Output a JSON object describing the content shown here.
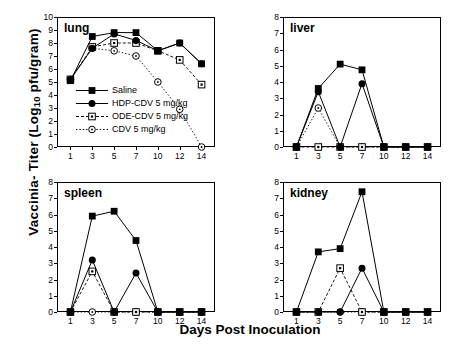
{
  "axes": {
    "ylabel_pre": "Vaccinia- Titer (Log",
    "ylabel_sub": "10",
    "ylabel_post": " pfu/gram)",
    "xlabel": "Days Post  Inoculation"
  },
  "legend": {
    "items": [
      {
        "label": "Saline",
        "marker": "filled-square",
        "line": "solid"
      },
      {
        "label": "HDP-CDV 5 mg/kg",
        "marker": "filled-circle",
        "line": "solid"
      },
      {
        "label": "ODE-CDV 5 mg/kg",
        "marker": "open-square",
        "line": "dashed"
      },
      {
        "label": "CDV 5 mg/kg",
        "marker": "open-circle",
        "line": "dotted"
      }
    ]
  },
  "chart_data": [
    {
      "type": "line",
      "title": "lung",
      "panel": "top-left",
      "x": [
        1,
        3,
        5,
        7,
        10,
        12,
        14
      ],
      "xlabel": "Days Post Inoculation",
      "ylabel": "Vaccinia- Titer (Log10 pfu/gram)",
      "xticklabels": [
        "1",
        "3",
        "5",
        "7",
        "10",
        "12",
        "14"
      ],
      "ylim": [
        0,
        10
      ],
      "yticks": [
        0,
        1,
        2,
        3,
        4,
        5,
        6,
        7,
        8,
        9,
        10
      ],
      "grid": false,
      "series": [
        {
          "name": "Saline",
          "marker": "filled-square",
          "line": "solid",
          "values": [
            5.1,
            8.5,
            8.8,
            8.8,
            7.4,
            8.0,
            6.4
          ]
        },
        {
          "name": "HDP-CDV 5 mg/kg",
          "marker": "filled-circle",
          "line": "solid",
          "values": [
            5.2,
            7.6,
            8.7,
            8.2,
            7.4,
            8.0,
            6.4
          ]
        },
        {
          "name": "ODE-CDV 5 mg/kg",
          "marker": "open-square",
          "line": "dashed",
          "values": [
            5.2,
            7.7,
            8.0,
            8.0,
            7.4,
            6.7,
            4.8
          ]
        },
        {
          "name": "CDV 5 mg/kg",
          "marker": "open-circle",
          "line": "dotted",
          "values": [
            5.2,
            7.6,
            7.4,
            7.0,
            5.0,
            2.9,
            0.0
          ]
        }
      ]
    },
    {
      "type": "line",
      "title": "liver",
      "panel": "top-right",
      "x": [
        1,
        3,
        5,
        7,
        10,
        12,
        14
      ],
      "xlabel": "Days Post Inoculation",
      "ylabel": "Vaccinia- Titer (Log10 pfu/gram)",
      "xticklabels": [
        "1",
        "3",
        "5",
        "7",
        "10",
        "12",
        "14"
      ],
      "ylim": [
        0,
        8
      ],
      "yticks": [
        0,
        1,
        2,
        3,
        4,
        5,
        6,
        7,
        8
      ],
      "grid": false,
      "series": [
        {
          "name": "Saline",
          "marker": "filled-square",
          "line": "solid",
          "values": [
            0.0,
            3.6,
            5.1,
            4.75,
            0.0,
            0.0,
            0.0
          ]
        },
        {
          "name": "HDP-CDV 5 mg/kg",
          "marker": "filled-circle",
          "line": "solid",
          "values": [
            0.0,
            3.4,
            0.0,
            3.9,
            0.0,
            0.0,
            0.0
          ]
        },
        {
          "name": "ODE-CDV 5 mg/kg",
          "marker": "open-square",
          "line": "dashed",
          "values": [
            0.0,
            0.0,
            0.0,
            0.0,
            0.0,
            0.0,
            0.0
          ]
        },
        {
          "name": "CDV 5 mg/kg",
          "marker": "open-circle",
          "line": "dotted",
          "values": [
            0.0,
            2.4,
            0.0,
            0.0,
            0.0,
            0.0,
            0.0
          ]
        }
      ]
    },
    {
      "type": "line",
      "title": "spleen",
      "panel": "bottom-left",
      "x": [
        1,
        3,
        5,
        7,
        10,
        12,
        14
      ],
      "xlabel": "Days Post Inoculation",
      "ylabel": "Vaccinia- Titer (Log10 pfu/gram)",
      "xticklabels": [
        "1",
        "3",
        "5",
        "7",
        "10",
        "12",
        "14"
      ],
      "ylim": [
        0,
        8
      ],
      "yticks": [
        0,
        1,
        2,
        3,
        4,
        5,
        6,
        7,
        8
      ],
      "grid": false,
      "series": [
        {
          "name": "Saline",
          "marker": "filled-square",
          "line": "solid",
          "values": [
            0.0,
            5.9,
            6.2,
            4.4,
            0.0,
            0.0,
            0.0
          ]
        },
        {
          "name": "HDP-CDV 5 mg/kg",
          "marker": "filled-circle",
          "line": "solid",
          "values": [
            0.0,
            3.2,
            0.0,
            2.4,
            0.0,
            0.0,
            0.0
          ]
        },
        {
          "name": "ODE-CDV 5 mg/kg",
          "marker": "open-square",
          "line": "dashed",
          "values": [
            0.0,
            2.5,
            0.0,
            0.0,
            0.0,
            0.0,
            0.0
          ]
        },
        {
          "name": "CDV 5 mg/kg",
          "marker": "open-circle",
          "line": "dotted",
          "values": [
            0.0,
            0.0,
            0.0,
            0.0,
            0.0,
            0.0,
            0.0
          ]
        }
      ]
    },
    {
      "type": "line",
      "title": "kidney",
      "panel": "bottom-right",
      "x": [
        1,
        3,
        5,
        7,
        10,
        12,
        14
      ],
      "xlabel": "Days Post Inoculation",
      "ylabel": "Vaccinia- Titer (Log10 pfu/gram)",
      "xticklabels": [
        "1",
        "3",
        "5",
        "7",
        "10",
        "12",
        "14"
      ],
      "ylim": [
        0,
        8
      ],
      "yticks": [
        0,
        1,
        2,
        3,
        4,
        5,
        6,
        7,
        8
      ],
      "grid": false,
      "series": [
        {
          "name": "Saline",
          "marker": "filled-square",
          "line": "solid",
          "values": [
            0.0,
            3.7,
            3.9,
            7.4,
            0.0,
            0.0,
            0.0
          ]
        },
        {
          "name": "HDP-CDV 5 mg/kg",
          "marker": "filled-circle",
          "line": "solid",
          "values": [
            0.0,
            0.0,
            0.0,
            2.7,
            0.0,
            0.0,
            0.0
          ]
        },
        {
          "name": "ODE-CDV 5 mg/kg",
          "marker": "open-square",
          "line": "dashed",
          "values": [
            0.0,
            0.0,
            2.7,
            0.0,
            0.0,
            0.0,
            0.0
          ]
        },
        {
          "name": "CDV 5 mg/kg",
          "marker": "open-circle",
          "line": "dotted",
          "values": [
            0.0,
            0.0,
            0.0,
            0.0,
            0.0,
            0.0,
            0.0
          ]
        }
      ]
    }
  ]
}
